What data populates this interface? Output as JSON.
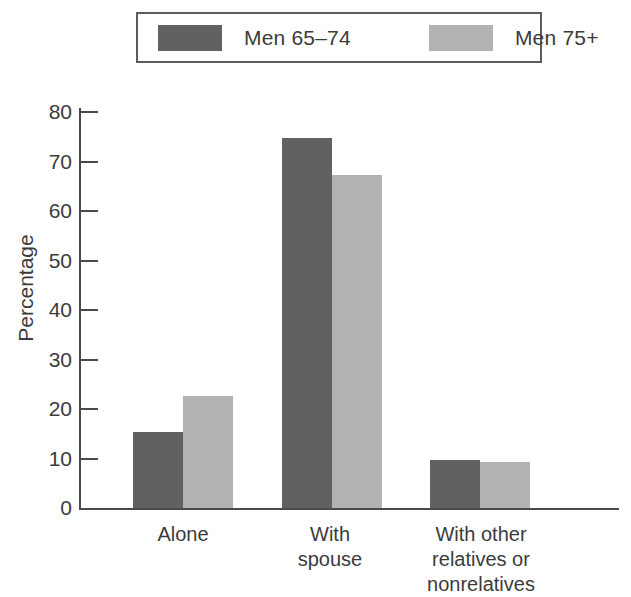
{
  "chart_data": {
    "type": "bar",
    "title": "",
    "subtitle": "",
    "xlabel": "",
    "ylabel": "Percentage",
    "categories": [
      "Alone",
      "With\nspouse",
      "With other\nrelatives or\nnonrelatives"
    ],
    "series": [
      {
        "name": "Men 65–74",
        "color": "#616161",
        "values": [
          15.3,
          74.8,
          9.6
        ]
      },
      {
        "name": "Men 75+",
        "color": "#b2b2b2",
        "values": [
          22.6,
          67.3,
          9.2
        ]
      }
    ],
    "ylim": [
      0,
      80
    ],
    "yticks": [
      0,
      10,
      20,
      30,
      40,
      50,
      60,
      70,
      80
    ],
    "ytick_labels": [
      "0",
      "10",
      "20",
      "30",
      "40",
      "50",
      "60",
      "70",
      "80"
    ],
    "grid": false,
    "legend_position": "top"
  },
  "legend": {
    "entries": [
      {
        "label": "Men 65–74",
        "color": "#616161"
      },
      {
        "label": "Men 75+",
        "color": "#b2b2b2"
      }
    ]
  },
  "axis": {
    "y_title": "Percentage"
  },
  "colors": {
    "series_dark": "#616161",
    "series_light": "#b2b2b2",
    "axis": "#4a4a4a",
    "text": "#3b3b3b",
    "background": "#ffffff"
  }
}
